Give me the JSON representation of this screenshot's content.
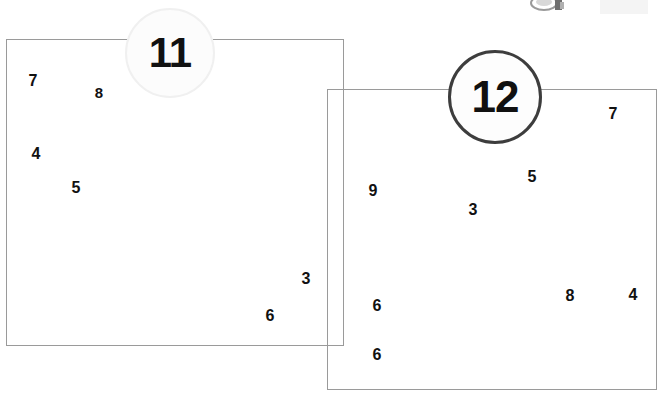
{
  "canvas": {
    "width": 665,
    "height": 399,
    "background": "#ffffff"
  },
  "regions": [
    {
      "id": "region-11",
      "label": "11",
      "label_shape": "circle",
      "label_center": {
        "x": 170,
        "y": 53
      },
      "label_radius": 45,
      "label_fill": "#fcfcfc",
      "label_border_color": "#f0f0f0",
      "label_border_width": 2,
      "label_font_size": 42,
      "box": {
        "x": 6,
        "y": 39,
        "width": 338,
        "height": 307
      },
      "box_border_color": "#9a9a9a",
      "box_border_width": 1.5,
      "points": [
        {
          "value": "7",
          "x": 33,
          "y": 81,
          "size": 16
        },
        {
          "value": "8",
          "x": 99,
          "y": 92,
          "size": 15
        },
        {
          "value": "4",
          "x": 36,
          "y": 154,
          "size": 16
        },
        {
          "value": "5",
          "x": 76,
          "y": 188,
          "size": 16
        },
        {
          "value": "3",
          "x": 306,
          "y": 279,
          "size": 16
        },
        {
          "value": "6",
          "x": 270,
          "y": 316,
          "size": 16
        }
      ]
    },
    {
      "id": "region-12",
      "label": "12",
      "label_shape": "circle",
      "label_center": {
        "x": 495,
        "y": 97
      },
      "label_radius": 47,
      "label_fill": "#fdfdfd",
      "label_border_color": "#3d3d3d",
      "label_border_width": 3,
      "label_font_size": 44,
      "box": {
        "x": 327,
        "y": 89,
        "width": 330,
        "height": 301
      },
      "box_border_color": "#9a9a9a",
      "box_border_width": 1.5,
      "points": [
        {
          "value": "7",
          "x": 613,
          "y": 114,
          "size": 16
        },
        {
          "value": "5",
          "x": 532,
          "y": 177,
          "size": 16
        },
        {
          "value": "9",
          "x": 373,
          "y": 191,
          "size": 16
        },
        {
          "value": "3",
          "x": 473,
          "y": 210,
          "size": 16
        },
        {
          "value": "8",
          "x": 570,
          "y": 296,
          "size": 16
        },
        {
          "value": "4",
          "x": 633,
          "y": 295,
          "size": 16
        },
        {
          "value": "6",
          "x": 377,
          "y": 306,
          "size": 16
        },
        {
          "value": "6",
          "x": 377,
          "y": 355,
          "size": 16
        }
      ]
    }
  ],
  "artifacts": [
    {
      "id": "clipped-object-top",
      "kind": "clipped-object",
      "x": 527,
      "y": 0,
      "width": 42,
      "height": 14,
      "color": "#8c8c8c"
    },
    {
      "id": "faint-smudge-top-right",
      "kind": "smudge",
      "x": 600,
      "y": 0,
      "width": 48,
      "height": 14,
      "color": "#f4f4f4"
    }
  ]
}
